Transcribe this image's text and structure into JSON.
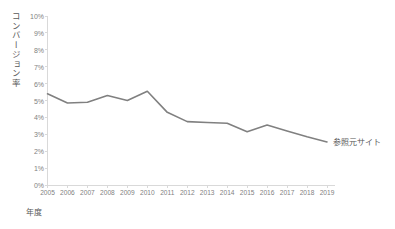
{
  "chart_data": {
    "type": "line",
    "title": "",
    "xlabel": "年度",
    "ylabel": "コンバージョン率",
    "categories": [
      "2005",
      "2006",
      "2007",
      "2008",
      "2009",
      "2010",
      "2011",
      "2012",
      "2013",
      "2014",
      "2015",
      "2016",
      "2017",
      "2018",
      "2019"
    ],
    "series": [
      {
        "name": "参照元サイト",
        "values": [
          5.4,
          4.85,
          4.9,
          5.3,
          5.0,
          5.55,
          4.3,
          3.75,
          3.7,
          3.65,
          3.15,
          3.55,
          3.2,
          2.85,
          2.55
        ],
        "color": "#808080"
      }
    ],
    "ylim": [
      0,
      10
    ],
    "ytick_values": [
      0,
      1,
      2,
      3,
      4,
      5,
      6,
      7,
      8,
      9,
      10
    ],
    "ytick_labels": [
      "0%",
      "1%",
      "2%",
      "3%",
      "4%",
      "5%",
      "6%",
      "7%",
      "8%",
      "9%",
      "10%"
    ],
    "grid": false,
    "legend_position": "inline-right",
    "axis_color": "#d9d9d9",
    "tick_label_color": "#7f7f7f",
    "axis_title_color": "#595959",
    "background_color": "#ffffff"
  },
  "series_label": {
    "text": "参照元サイト"
  }
}
